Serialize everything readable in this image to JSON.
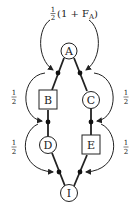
{
  "diagram": {
    "top_label": {
      "frac_num": "1",
      "frac_den": "2",
      "text": "(1 + F",
      "sub": "A",
      "close": ")"
    },
    "nodes": [
      {
        "id": "A",
        "label": "A",
        "shape": "circle"
      },
      {
        "id": "B",
        "label": "B",
        "shape": "square"
      },
      {
        "id": "C",
        "label": "C",
        "shape": "circle"
      },
      {
        "id": "D",
        "label": "D",
        "shape": "circle"
      },
      {
        "id": "E",
        "label": "E",
        "shape": "square"
      },
      {
        "id": "I",
        "label": "I",
        "shape": "circle"
      }
    ],
    "side_labels": {
      "left_upper": {
        "num": "1",
        "den": "2"
      },
      "right_upper": {
        "num": "1",
        "den": "2"
      },
      "left_lower": {
        "num": "1",
        "den": "2"
      },
      "right_lower": {
        "num": "1",
        "den": "2"
      }
    },
    "edges": [
      {
        "from": "A",
        "to": "B"
      },
      {
        "from": "A",
        "to": "C"
      },
      {
        "from": "B",
        "to": "D"
      },
      {
        "from": "C",
        "to": "E"
      },
      {
        "from": "D",
        "to": "I"
      },
      {
        "from": "E",
        "to": "I"
      }
    ]
  }
}
